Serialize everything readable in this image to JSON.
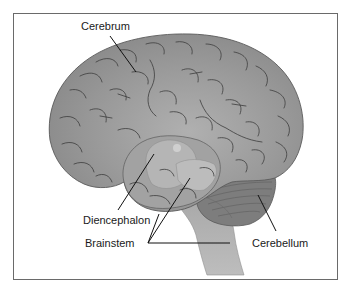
{
  "figure": {
    "labels": {
      "cerebrum": "Cerebrum",
      "diencephalon": "Diencephalon",
      "brainstem": "Brainstem",
      "cerebellum": "Cerebellum"
    },
    "colors": {
      "cerebrum_fill": "#8f8f8f",
      "cerebrum_light": "#a8a8a8",
      "diencephalon_fill": "#b3b3b3",
      "brainstem_fill": "#b8b8b8",
      "cerebellum_fill": "#7a7a7a",
      "sulci_stroke": "#3c3c3c",
      "frame_border": "#6a6a6a",
      "leader_line": "#111111"
    }
  }
}
